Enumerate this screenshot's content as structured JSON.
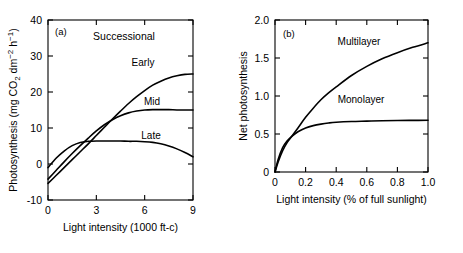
{
  "figure": {
    "background": "#ffffff",
    "line_color": "#000000"
  },
  "chart_data": [
    {
      "id": "panel-a",
      "type": "line",
      "panel_label": "(a)",
      "title": "Successional",
      "xlabel": "Light intensity (1000 ft-c)",
      "ylabel": "Photosynthesis (mg CO₂ dm⁻² h⁻¹)",
      "xlim": [
        0,
        9
      ],
      "ylim": [
        -10,
        40
      ],
      "xticks": [
        0,
        3,
        6,
        9
      ],
      "xticklabels": [
        "0",
        "3",
        "6",
        "9"
      ],
      "yticks": [
        -10,
        0,
        10,
        20,
        30,
        40
      ],
      "yticklabels": [
        "-10",
        "0",
        "10",
        "20",
        "30",
        "40"
      ],
      "grid": false,
      "legend": "inline-curve-labels",
      "series": [
        {
          "name": "Early",
          "label": "Early",
          "x": [
            0,
            0.5,
            1,
            1.5,
            2,
            2.5,
            3,
            3.5,
            4,
            4.5,
            5,
            5.5,
            6,
            6.5,
            7,
            7.5,
            8,
            8.5,
            9
          ],
          "values": [
            -5.4,
            -3.2,
            -1.0,
            1.2,
            3.4,
            5.6,
            7.9,
            10.2,
            12.5,
            14.7,
            16.8,
            18.7,
            20.4,
            21.9,
            23.0,
            23.9,
            24.5,
            24.9,
            25.0
          ]
        },
        {
          "name": "Mid",
          "label": "Mid",
          "x": [
            0,
            0.5,
            1,
            1.5,
            2,
            2.5,
            3,
            3.5,
            4,
            4.5,
            5,
            5.5,
            6,
            6.5,
            7,
            7.5,
            8,
            8.5,
            9
          ],
          "values": [
            -4.2,
            -1.8,
            0.6,
            2.9,
            5.1,
            7.2,
            9.2,
            10.9,
            12.3,
            13.4,
            14.2,
            14.7,
            15.0,
            15.1,
            15.1,
            15.1,
            15.0,
            15.0,
            15.0
          ]
        },
        {
          "name": "Late",
          "label": "Late",
          "x": [
            0,
            0.5,
            1,
            1.5,
            2,
            2.5,
            3,
            3.5,
            4,
            4.5,
            5,
            5.5,
            6,
            6.5,
            7,
            7.5,
            8,
            8.5,
            9
          ],
          "values": [
            -1.0,
            1.6,
            3.6,
            5.1,
            6.0,
            6.3,
            6.4,
            6.4,
            6.4,
            6.4,
            6.3,
            6.3,
            6.2,
            6.0,
            5.6,
            5.0,
            4.2,
            3.2,
            2.0
          ]
        }
      ]
    },
    {
      "id": "panel-b",
      "type": "line",
      "panel_label": "(b)",
      "title": "",
      "xlabel": "Light intensity (% of full sunlight)",
      "ylabel": "Net photosynthesis",
      "xlim": [
        0,
        1.0
      ],
      "ylim": [
        0,
        2.0
      ],
      "xticks": [
        0,
        0.2,
        0.4,
        0.6,
        0.8,
        1.0
      ],
      "xticklabels": [
        "0",
        "0.2",
        "0.4",
        "0.6",
        "0.8",
        "1.0"
      ],
      "yticks": [
        0,
        0.5,
        1.0,
        1.5,
        2.0
      ],
      "yticklabels": [
        "0",
        "0.5",
        "1.0",
        "1.5",
        "2.0"
      ],
      "grid": false,
      "legend": "inline-curve-labels",
      "series": [
        {
          "name": "Multilayer",
          "label": "Multilayer",
          "x": [
            0,
            0.02,
            0.05,
            0.08,
            0.11,
            0.15,
            0.2,
            0.25,
            0.3,
            0.35,
            0.4,
            0.5,
            0.6,
            0.7,
            0.8,
            0.9,
            1.0
          ],
          "values": [
            0.0,
            0.13,
            0.28,
            0.39,
            0.47,
            0.58,
            0.72,
            0.84,
            0.95,
            1.04,
            1.12,
            1.27,
            1.39,
            1.49,
            1.57,
            1.64,
            1.7
          ]
        },
        {
          "name": "Monolayer",
          "label": "Monolayer",
          "x": [
            0,
            0.02,
            0.05,
            0.08,
            0.11,
            0.15,
            0.2,
            0.25,
            0.3,
            0.35,
            0.4,
            0.5,
            0.6,
            0.7,
            0.8,
            0.9,
            1.0
          ],
          "values": [
            0.0,
            0.16,
            0.32,
            0.41,
            0.47,
            0.53,
            0.58,
            0.61,
            0.63,
            0.645,
            0.655,
            0.665,
            0.67,
            0.675,
            0.678,
            0.679,
            0.68
          ]
        }
      ]
    }
  ]
}
